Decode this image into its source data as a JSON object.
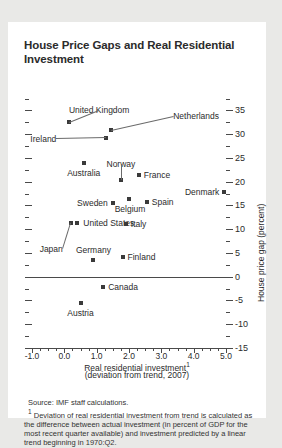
{
  "figure": {
    "title": "House Price Gaps and Real Residential Investment",
    "source": "Source: IMF staff calculations.",
    "footnote_marker": "1",
    "footnote": "Deviation of real residential investment from trend is calculated as the difference between actual investment (in percent of GDP for the most recent quarter available) and investment predicted by a linear trend beginning in 1970:Q2.",
    "marker_color": "#3a3a3a",
    "axis_color": "#4a4a4a",
    "card_background": "#ffffff",
    "page_background": "#e9e9e7"
  },
  "chart_data": {
    "type": "scatter",
    "title": "House Price Gaps and Real Residential Investment",
    "xlabel": "Real residential investment",
    "xlabel_sup": "1",
    "xlabel_sub": "(deviation from trend, 2007)",
    "ylabel": "House price gap (percent)",
    "xlim": [
      -1.0,
      5.0
    ],
    "ylim": [
      -15,
      35.5
    ],
    "grid": false,
    "legend": "none",
    "y_axis_side": "right",
    "xticks": [
      "-1.0",
      "0.0",
      "1.0",
      "2.0",
      "3.0",
      "4.0",
      "5.0"
    ],
    "xtick_values": [
      -1.0,
      0.0,
      1.0,
      2.0,
      3.0,
      4.0,
      5.0
    ],
    "yticks": [
      "35",
      "30",
      "25",
      "20",
      "15",
      "10",
      "5",
      "0",
      "-5",
      "-10",
      "-15"
    ],
    "ytick_values": [
      35,
      30,
      25,
      20,
      15,
      10,
      5,
      0,
      -5,
      -10,
      -15
    ],
    "zero_line": 0,
    "points": [
      {
        "name": "United Kingdom",
        "x": 0.15,
        "y": 32.6,
        "label_pos": "c",
        "label_dx": 30,
        "label_dy": -12,
        "leader": true
      },
      {
        "name": "Netherlands",
        "x": 1.45,
        "y": 30.8,
        "label_pos": "l",
        "label_dx": 62,
        "label_dy": -14,
        "leader": true
      },
      {
        "name": "Ireland",
        "x": 1.3,
        "y": 29.1,
        "label_pos": "r",
        "label_dx": -50,
        "label_dy": 1,
        "leader": true
      },
      {
        "name": "Australia",
        "x": 0.6,
        "y": 24.0,
        "label_pos": "c",
        "label_dx": 0,
        "label_dy": 10,
        "leader": false
      },
      {
        "name": "Norway",
        "x": 1.75,
        "y": 20.3,
        "label_pos": "c",
        "label_dx": 0,
        "label_dy": -16,
        "leader": true
      },
      {
        "name": "France",
        "x": 2.3,
        "y": 21.3,
        "label_pos": "l",
        "label_dx": 5,
        "label_dy": 0,
        "leader": false
      },
      {
        "name": "Denmark",
        "x": 4.95,
        "y": 17.9,
        "label_pos": "r",
        "label_dx": -5,
        "label_dy": 0,
        "leader": false
      },
      {
        "name": "Sweden",
        "x": 1.5,
        "y": 15.5,
        "label_pos": "r",
        "label_dx": -5,
        "label_dy": 0,
        "leader": false
      },
      {
        "name": "Belgium",
        "x": 2.0,
        "y": 16.4,
        "label_pos": "c",
        "label_dx": 1,
        "label_dy": 10,
        "leader": false
      },
      {
        "name": "Spain",
        "x": 2.55,
        "y": 15.7,
        "label_pos": "l",
        "label_dx": 5,
        "label_dy": 0,
        "leader": false
      },
      {
        "name": "United States",
        "x": 0.4,
        "y": 11.3,
        "label_pos": "l",
        "label_dx": 6,
        "label_dy": 0,
        "leader": false
      },
      {
        "name": "Japan",
        "x": 0.2,
        "y": 11.3,
        "label_pos": "r",
        "label_dx": -8,
        "label_dy": 26,
        "leader": true
      },
      {
        "name": "Italy",
        "x": 1.9,
        "y": 11.0,
        "label_pos": "l",
        "label_dx": 5,
        "label_dy": 0,
        "leader": false
      },
      {
        "name": "Germany",
        "x": 0.9,
        "y": 3.5,
        "label_pos": "c",
        "label_dx": 0,
        "label_dy": -10,
        "leader": false
      },
      {
        "name": "Finland",
        "x": 1.8,
        "y": 4.2,
        "label_pos": "l",
        "label_dx": 5,
        "label_dy": 0,
        "leader": false
      },
      {
        "name": "Canada",
        "x": 1.2,
        "y": -2.2,
        "label_pos": "l",
        "label_dx": 5,
        "label_dy": 0,
        "leader": false
      },
      {
        "name": "Austria",
        "x": 0.5,
        "y": -5.5,
        "label_pos": "c",
        "label_dx": 0,
        "label_dy": 10,
        "leader": false
      }
    ]
  }
}
